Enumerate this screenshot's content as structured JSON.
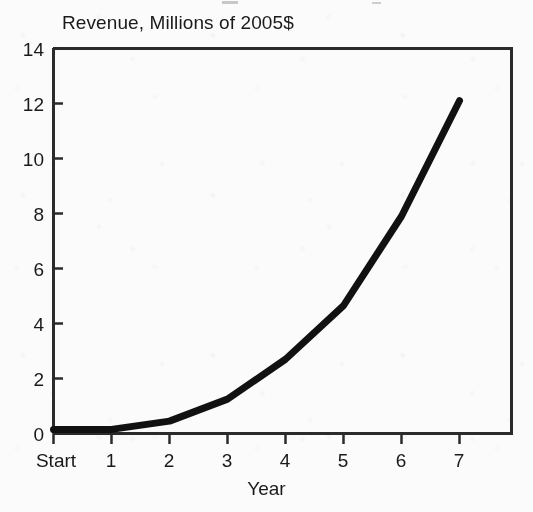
{
  "chart_data": {
    "type": "line",
    "title": "Revenue, Millions of 2005$",
    "xlabel": "Year",
    "ylabel": "",
    "categories": [
      "Start",
      "1",
      "2",
      "3",
      "4",
      "5",
      "6",
      "7"
    ],
    "x": [
      0,
      1,
      2,
      3,
      4,
      5,
      6,
      7
    ],
    "values": [
      0.15,
      0.15,
      0.45,
      1.25,
      2.7,
      4.65,
      7.9,
      12.1
    ],
    "series": [
      {
        "name": "Revenue",
        "values": [
          0.15,
          0.15,
          0.45,
          1.25,
          2.7,
          4.65,
          7.9,
          12.1
        ]
      }
    ],
    "ylim": [
      0,
      14
    ],
    "yticks": [
      0,
      2,
      4,
      6,
      8,
      10,
      12,
      14
    ],
    "ytick_labels": [
      "0",
      "2",
      "4",
      "6",
      "8",
      "10",
      "12",
      "14"
    ],
    "xtick_labels": [
      "Start",
      "1",
      "2",
      "3",
      "4",
      "5",
      "6",
      "7"
    ],
    "grid": false,
    "legend": false,
    "legend_position": "none",
    "line_color": "#111111",
    "line_width": 7,
    "axis_color": "#2b2b2b",
    "background_color": "#fbfbfb",
    "plot_box_sides": [
      "left",
      "top",
      "right"
    ]
  },
  "axes": {
    "y_labels": [
      "14",
      "12",
      "10",
      "8",
      "6",
      "4",
      "2",
      "0"
    ],
    "x_labels": [
      "Start",
      "1",
      "2",
      "3",
      "4",
      "5",
      "6",
      "7"
    ],
    "x_title": "Year"
  }
}
